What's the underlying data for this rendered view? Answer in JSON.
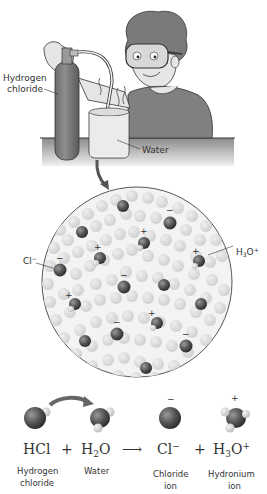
{
  "scene": {
    "cylinder_label_line1": "Hydrogen",
    "cylinder_label_line2": "chloride",
    "beaker_label": "Water"
  },
  "molecular_view": {
    "chloride_label": "Cl",
    "chloride_charge": "−",
    "hydronium_label": "H",
    "hydronium_sub": "3",
    "hydronium_o": "O",
    "hydronium_charge": "+"
  },
  "equation": {
    "reactant1": {
      "formula": "HCl",
      "name_line1": "Hydrogen",
      "name_line2": "chloride"
    },
    "plus1": "+",
    "reactant2": {
      "formula_h": "H",
      "formula_sub": "2",
      "formula_o": "O",
      "name_line1": "Water"
    },
    "arrow": "⟶",
    "product1": {
      "formula": "Cl",
      "charge": "−",
      "name_line1": "Chloride",
      "name_line2": "ion",
      "sign": "−"
    },
    "plus2": "+",
    "product2": {
      "formula_h": "H",
      "formula_sub": "3",
      "formula_o": "O",
      "charge": "+",
      "name_line1": "Hydronium",
      "name_line2": "ion",
      "sign": "+"
    }
  }
}
